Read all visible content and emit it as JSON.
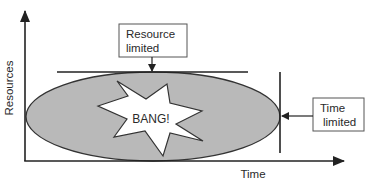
{
  "diagram": {
    "type": "resource-time constraint diagram",
    "axes": {
      "y_label": "Resources",
      "x_label": "Time"
    },
    "ellipse": {
      "fill": "#b9b9b9",
      "stroke": "#333333"
    },
    "burst": {
      "label": "BANG!",
      "fill": "#ffffff"
    },
    "callouts": [
      {
        "id": "resource",
        "line1": "Resource",
        "line2": "limited"
      },
      {
        "id": "time",
        "line1": "Time",
        "line2": "limited"
      }
    ],
    "colors": {
      "line": "#222222",
      "text": "#2a2a2a",
      "background": "#ffffff"
    }
  }
}
